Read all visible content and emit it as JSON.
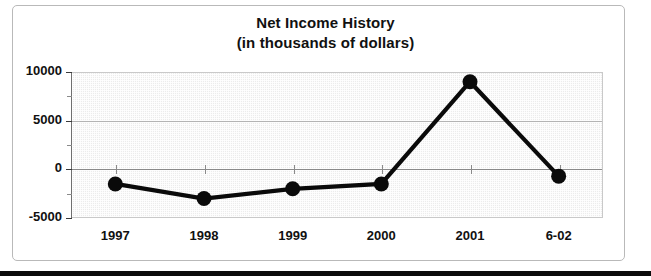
{
  "chart_data": {
    "type": "line",
    "title": "Net Income History",
    "subtitle": "(in thousands of dollars)",
    "xlabel": "",
    "ylabel": "",
    "categories": [
      "1997",
      "1998",
      "1999",
      "2000",
      "2001",
      "6-02"
    ],
    "values": [
      -1500,
      -3000,
      -2000,
      -1500,
      9000,
      -700
    ],
    "series": [
      {
        "name": "Net Income",
        "values": [
          -1500,
          -3000,
          -2000,
          -1500,
          9000,
          -700
        ]
      }
    ],
    "ylim": [
      -5000,
      10000
    ],
    "yticks": [
      10000,
      5000,
      0,
      -5000
    ],
    "ytick_labels": [
      "10000",
      "5000",
      "0",
      "-5000"
    ],
    "yminor_ticks": [
      7500,
      2500,
      -2500
    ],
    "grid": true,
    "legend": false,
    "legend_position": "none",
    "marker": "filled-circle",
    "line_color": "#0a0a0a",
    "marker_color": "#0a0a0a",
    "plot_background": "#ececec",
    "gridline_color": "#b4b4b4",
    "zero_line_color": "#8a8a8a"
  },
  "frame": {
    "border_color": "#b9b9b9",
    "page_rule_color": "#0b0b0b"
  }
}
